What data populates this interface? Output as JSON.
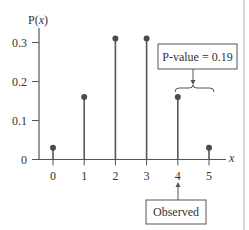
{
  "chart_data": {
    "type": "bar",
    "subtype": "stem",
    "title": "",
    "ylabel": "P(x)",
    "xlabel": "x",
    "categories": [
      "0",
      "1",
      "2",
      "3",
      "4",
      "5"
    ],
    "x": [
      0,
      1,
      2,
      3,
      4,
      5
    ],
    "values": [
      0.03,
      0.16,
      0.31,
      0.31,
      0.16,
      0.03
    ],
    "ylim": [
      0,
      0.33
    ],
    "yticks": [
      0,
      0.1,
      0.2,
      0.3
    ],
    "ytick_labels": [
      "0",
      "0.1",
      "0.2",
      "0.3"
    ],
    "xtick_labels": [
      "0",
      "1",
      "2",
      "3",
      "4",
      "5"
    ],
    "grid": false,
    "legend": null,
    "annotations": [
      {
        "text": "P-value = 0.19",
        "type": "boxed-label",
        "points_to": "brace over x=4 and x=5"
      },
      {
        "text": "Observed",
        "type": "boxed-label",
        "points_to": "x=4"
      }
    ]
  },
  "labels": {
    "y_axis": "P(",
    "y_axis_var": "x",
    "y_axis_close": ")",
    "x_axis": "x",
    "pvalue_box": "P-value = 0.19",
    "observed_box": "Observed"
  },
  "colors": {
    "stem": "#555555",
    "dot": "#4a4a4a",
    "axis": "#555555",
    "text": "#333333"
  }
}
